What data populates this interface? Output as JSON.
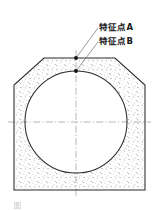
{
  "figure": {
    "type": "engineering-cross-section-drawing",
    "caption": "图",
    "annotations": [
      {
        "id": "A",
        "label": "特征点A",
        "marker": "filled-dot",
        "location": "top-edge-of-outer-lining",
        "x": 76,
        "y": 58
      },
      {
        "id": "B",
        "label": "特征点B",
        "marker": "filled-dot",
        "location": "crown-of-inner-circle",
        "x": 76,
        "y": 71
      }
    ],
    "colors": {
      "outline": "#2b2b2b",
      "fill_hatch": "#7d7d7d",
      "background": "#ffffff",
      "centerline": "#9a9a9a",
      "leader": "#6e6e6e",
      "text": "#1a1a1a"
    },
    "geometry": {
      "outer_polygon": [
        [
          44,
          58
        ],
        [
          115,
          58
        ],
        [
          145,
          85
        ],
        [
          145,
          190
        ],
        [
          14,
          190
        ],
        [
          14,
          85
        ]
      ],
      "inner_circle": {
        "cx": 76,
        "cy": 122,
        "r": 51
      },
      "centerline_vertical": {
        "x": 76,
        "y1": 50,
        "y2": 198
      },
      "centerline_horizontal": {
        "y": 122,
        "x1": 8,
        "x2": 151
      }
    }
  }
}
